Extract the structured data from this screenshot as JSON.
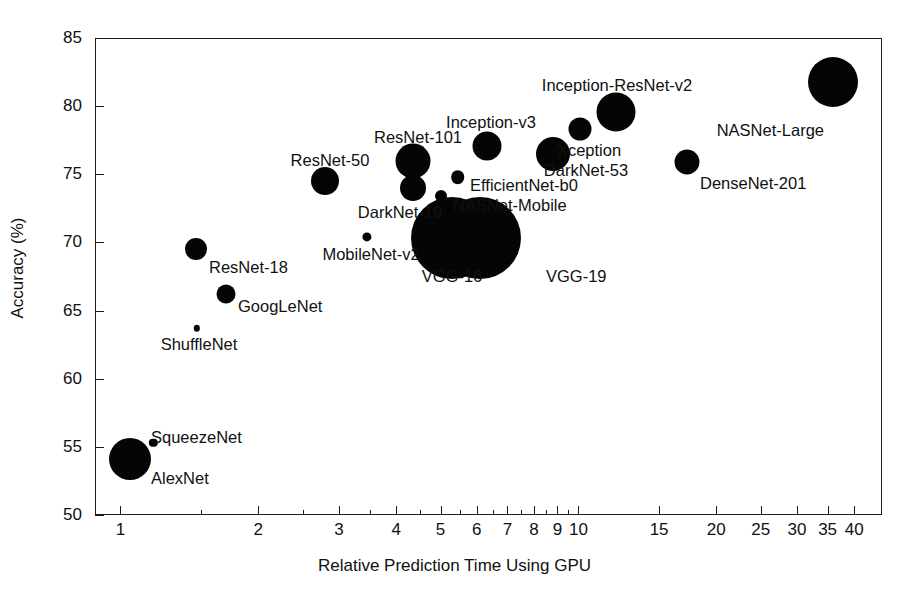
{
  "chart_data": {
    "type": "scatter",
    "title": "",
    "xlabel": "Relative Prediction Time Using GPU",
    "ylabel": "Accuracy (%)",
    "xscale": "log",
    "xlim": [
      0.88,
      46
    ],
    "ylim": [
      50,
      85
    ],
    "grid": false,
    "legend": "none",
    "size_encodes": "network size (number of parameters)",
    "xticks": [
      1,
      2,
      3,
      4,
      5,
      6,
      7,
      8,
      9,
      10,
      15,
      20,
      25,
      30,
      35,
      40
    ],
    "xtick_labels": [
      "1",
      "2",
      "3",
      "4",
      "5",
      "6",
      "7",
      "8",
      "9",
      "10",
      "15",
      "20",
      "25",
      "30",
      "35",
      "40"
    ],
    "yticks": [
      50,
      55,
      60,
      65,
      70,
      75,
      80,
      85
    ],
    "ytick_labels": [
      "50",
      "55",
      "60",
      "65",
      "70",
      "75",
      "80",
      "85"
    ],
    "points": [
      {
        "name": "AlexNet",
        "x": 1.05,
        "y": 54.1,
        "r": 21.0,
        "lx": 151,
        "ly": 478,
        "anchor": "start"
      },
      {
        "name": "SqueezeNet",
        "x": 1.18,
        "y": 55.3,
        "r": 4.2,
        "lx": 151,
        "ly": 437,
        "anchor": "start"
      },
      {
        "name": "ResNet-18",
        "x": 1.46,
        "y": 69.5,
        "r": 11.0,
        "lx": 209,
        "ly": 267,
        "anchor": "start"
      },
      {
        "name": "GoogLeNet",
        "x": 1.7,
        "y": 66.2,
        "r": 9.5,
        "lx": 238,
        "ly": 306,
        "anchor": "start"
      },
      {
        "name": "ShuffleNet",
        "x": 1.47,
        "y": 63.7,
        "r": 3.2,
        "lx": 199,
        "ly": 344,
        "anchor": "mid"
      },
      {
        "name": "ResNet-50",
        "x": 2.8,
        "y": 74.5,
        "r": 14.0,
        "lx": 330,
        "ly": 160,
        "anchor": "mid"
      },
      {
        "name": "MobileNet-v2",
        "x": 3.45,
        "y": 70.4,
        "r": 4.6,
        "lx": 371,
        "ly": 254,
        "anchor": "mid"
      },
      {
        "name": "ResNet-101",
        "x": 4.35,
        "y": 76.0,
        "r": 17.5,
        "lx": 418,
        "ly": 137,
        "anchor": "mid"
      },
      {
        "name": "DarkNet-19",
        "x": 4.35,
        "y": 74.0,
        "r": 13.0,
        "lx": 400,
        "ly": 212,
        "anchor": "mid"
      },
      {
        "name": "NASNet-Mobile",
        "x": 5.0,
        "y": 73.4,
        "r": 6.0,
        "lx": 453,
        "ly": 205,
        "anchor": "start"
      },
      {
        "name": "EfficientNet-b0",
        "x": 5.45,
        "y": 74.8,
        "r": 6.8,
        "lx": 470,
        "ly": 185,
        "anchor": "start"
      },
      {
        "name": "VGG-16",
        "x": 5.3,
        "y": 70.3,
        "r": 41.0,
        "lx": 452,
        "ly": 276,
        "anchor": "mid"
      },
      {
        "name": "VGG-19",
        "x": 6.1,
        "y": 70.3,
        "r": 41.0,
        "lx": 546,
        "ly": 276,
        "anchor": "start"
      },
      {
        "name": "Inception-v3",
        "x": 6.3,
        "y": 77.1,
        "r": 14.5,
        "lx": 491,
        "ly": 122,
        "anchor": "mid"
      },
      {
        "name": "DarkNet-53",
        "x": 8.8,
        "y": 76.5,
        "r": 17.0,
        "lx": 586,
        "ly": 170,
        "anchor": "mid"
      },
      {
        "name": "Xception",
        "x": 10.1,
        "y": 78.3,
        "r": 11.5,
        "lx": 589,
        "ly": 150,
        "anchor": "mid"
      },
      {
        "name": "Inception-ResNet-v2",
        "x": 12.1,
        "y": 79.6,
        "r": 19.5,
        "lx": 617,
        "ly": 85,
        "anchor": "mid"
      },
      {
        "name": "DenseNet-201",
        "x": 17.3,
        "y": 75.9,
        "r": 12.5,
        "lx": 700,
        "ly": 183,
        "anchor": "start"
      },
      {
        "name": "NASNet-Large",
        "x": 36.0,
        "y": 81.8,
        "r": 25.0,
        "lx": 824,
        "ly": 130,
        "anchor": "end"
      }
    ]
  }
}
